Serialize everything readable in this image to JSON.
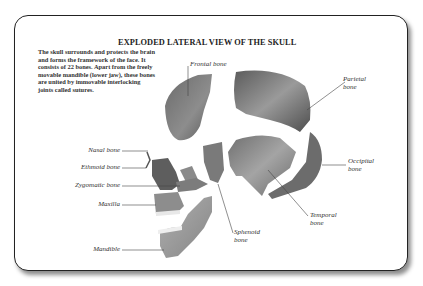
{
  "diagram": {
    "title": "EXPLODED LATERAL VIEW OF THE SKULL",
    "description": "The skull surrounds and protects the brain and forms the framework of the face. It consists of 22 bones. Apart from the freely movable mandible (lower jaw), these bones are united by immovable interlocking joints called sutures.",
    "labels": {
      "frontal": "Frontal bone",
      "parietal_1": "Parietal",
      "parietal_2": "bone",
      "nasal": "Nasal bone",
      "ethmoid": "Ethmoid bone",
      "zygomatic": "Zygomatic bone",
      "maxilla": "Maxilla",
      "mandible": "Mandible",
      "occipital_1": "Occipital",
      "occipital_2": "bone",
      "temporal_1": "Temporal",
      "temporal_2": "bone",
      "sphenoid_1": "Sphenoid",
      "sphenoid_2": "bone"
    },
    "bone_count": 22,
    "colors": {
      "bone_dark": "#5a5a5a",
      "bone_light": "#a8a8a8",
      "suture_gap": "#ffffff",
      "card_border": "#222222"
    }
  }
}
